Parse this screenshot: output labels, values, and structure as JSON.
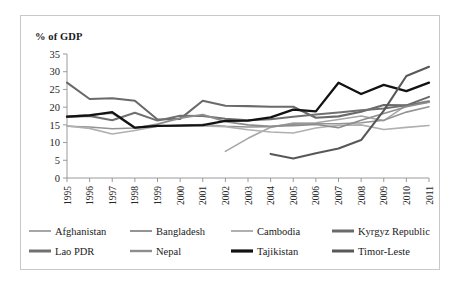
{
  "chart_data": {
    "type": "line",
    "title": "",
    "ylabel": "% of GDP",
    "xlabel": "",
    "ylim": [
      0,
      35
    ],
    "ytick_step": 5,
    "yticks": [
      "0",
      "5",
      "10",
      "15",
      "20",
      "25",
      "30",
      "35"
    ],
    "grid": false,
    "legend_position": "bottom",
    "x": [
      1995,
      1996,
      1997,
      1998,
      1999,
      2000,
      2001,
      2002,
      2003,
      2004,
      2005,
      2006,
      2007,
      2008,
      2009,
      2010,
      2011
    ],
    "categories": [
      "1995",
      "1996",
      "1997",
      "1998",
      "1999",
      "2000",
      "2001",
      "2002",
      "2003",
      "2004",
      "2005",
      "2006",
      "2007",
      "2008",
      "2009",
      "2010",
      "2011"
    ],
    "series": [
      {
        "name": "Afghanistan",
        "color": "#a6a6a6",
        "width": 1.6,
        "values": [
          null,
          null,
          null,
          null,
          null,
          null,
          null,
          7.5,
          11.2,
          14.3,
          15.5,
          15.6,
          16.5,
          17.5,
          16.2,
          20.5,
          21.8
        ]
      },
      {
        "name": "Bangladesh",
        "color": "#949494",
        "width": 1.6,
        "values": [
          14.6,
          14.4,
          13.9,
          14.1,
          14.6,
          14.9,
          15.1,
          14.6,
          14.4,
          14.5,
          15.2,
          15.3,
          15.3,
          15.6,
          16.3,
          18.6,
          20.1
        ]
      },
      {
        "name": "Cambodia",
        "color": "#b0b0b0",
        "width": 1.6,
        "values": [
          14.7,
          14.0,
          12.4,
          13.4,
          14.6,
          14.8,
          14.7,
          14.5,
          13.6,
          13.0,
          12.7,
          14.1,
          14.9,
          15.0,
          13.7,
          14.3,
          14.8
        ]
      },
      {
        "name": "Kyrgyz Republic",
        "color": "#6a6a6a",
        "width": 2.1,
        "values": [
          26.9,
          22.3,
          22.5,
          21.8,
          16.5,
          16.7,
          21.8,
          20.4,
          20.3,
          20.1,
          20.1,
          17.0,
          17.4,
          18.7,
          20.6,
          20.5,
          22.9
        ]
      },
      {
        "name": "Lao PDR",
        "color": "#707070",
        "width": 2.0,
        "values": [
          17.2,
          17.5,
          16.3,
          18.4,
          16.2,
          17.6,
          17.5,
          16.7,
          16.3,
          16.6,
          17.3,
          17.9,
          18.5,
          19.1,
          19.6,
          20.5,
          21.5
        ]
      },
      {
        "name": "Nepal",
        "color": "#8d8d8d",
        "width": 1.7,
        "values": [
          17.4,
          17.8,
          18.3,
          14.1,
          15.2,
          16.9,
          17.9,
          15.9,
          15.0,
          14.6,
          14.8,
          15.1,
          14.2,
          16.3,
          18.2,
          20.1,
          21.4
        ]
      },
      {
        "name": "Tajikistan",
        "color": "#121212",
        "width": 2.3,
        "values": [
          17.3,
          17.7,
          18.6,
          14.2,
          14.7,
          14.8,
          14.9,
          16.1,
          16.2,
          17.1,
          19.3,
          18.8,
          26.9,
          23.7,
          26.3,
          24.5,
          26.9
        ]
      },
      {
        "name": "Timor-Leste",
        "color": "#585858",
        "width": 2.1,
        "values": [
          null,
          null,
          null,
          null,
          null,
          null,
          null,
          null,
          null,
          6.8,
          5.5,
          7.0,
          8.3,
          10.7,
          19.0,
          28.8,
          31.4
        ]
      }
    ]
  },
  "legend": {
    "rows": [
      [
        {
          "label": "Afghanistan"
        },
        {
          "label": "Bangladesh"
        },
        {
          "label": "Cambodia"
        },
        {
          "label": "Kyrgyz Republic"
        }
      ],
      [
        {
          "label": "Lao PDR"
        },
        {
          "label": "Nepal"
        },
        {
          "label": "Tajikistan"
        },
        {
          "label": "Timor-Leste"
        }
      ]
    ]
  }
}
